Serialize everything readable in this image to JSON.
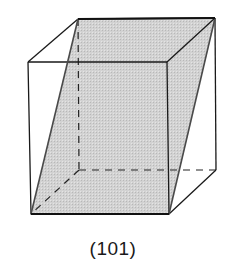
{
  "figure": {
    "label": "(101)",
    "plane_fill": "#cfcfcf",
    "edge_color": "#1a1a1a",
    "vertices": {
      "front_top_left": [
        28,
        62
      ],
      "front_top_right": [
        167,
        62
      ],
      "front_bottom_left": [
        31,
        214
      ],
      "front_bottom_right": [
        169,
        214
      ],
      "back_top_left": [
        78,
        19
      ],
      "back_top_right": [
        215,
        18
      ],
      "back_bottom_left": [
        79,
        170
      ],
      "back_bottom_right": [
        216,
        170
      ]
    }
  }
}
